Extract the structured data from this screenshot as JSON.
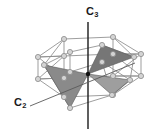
{
  "figure": {
    "name": "symmetry-axes-diagram",
    "background_color": "#ffffff"
  },
  "labels": {
    "c3": {
      "text": "C",
      "subscript": "3",
      "name": "c3-axis-label"
    },
    "c2": {
      "text": "C",
      "subscript": "2",
      "name": "c2-axis-label"
    }
  },
  "colors": {
    "axis_line": "#1a1a1a",
    "cage_edge": "#8c8c8c",
    "vertex_fill": "#d4d4d4",
    "vertex_stroke": "#8a8a8a",
    "face_dark": "#767676",
    "face_mid": "#8a8a8a",
    "face_light": "#9e9e9e",
    "face_edge": "#5a5a5a",
    "center_dot": "#111111"
  },
  "geometry": {
    "center": {
      "x": 88,
      "y": 74
    },
    "c3_axis": {
      "x1": 88,
      "y1": 22,
      "x2": 88,
      "y2": 129
    },
    "c2_axis": {
      "x1": 30,
      "y1": 106,
      "x2": 135,
      "y2": 63
    },
    "top_hexagon": [
      {
        "x": 68,
        "y": 46
      },
      {
        "x": 108,
        "y": 44
      },
      {
        "x": 132,
        "y": 58
      },
      {
        "x": 115,
        "y": 70
      },
      {
        "x": 73,
        "y": 71
      },
      {
        "x": 49,
        "y": 57
      }
    ],
    "bottom_hexagon": [
      {
        "x": 68,
        "y": 65
      },
      {
        "x": 108,
        "y": 63
      },
      {
        "x": 132,
        "y": 77
      },
      {
        "x": 115,
        "y": 90
      },
      {
        "x": 73,
        "y": 91
      },
      {
        "x": 49,
        "y": 76
      }
    ],
    "outer_top": [
      {
        "x": 64,
        "y": 39
      },
      {
        "x": 113,
        "y": 37
      },
      {
        "x": 141,
        "y": 54
      },
      {
        "x": 141,
        "y": 76
      },
      {
        "x": 113,
        "y": 95
      },
      {
        "x": 64,
        "y": 97
      },
      {
        "x": 38,
        "y": 79
      },
      {
        "x": 38,
        "y": 57
      }
    ],
    "faces": [
      {
        "name": "blade-upper",
        "tone": "dark",
        "points": "88,74 102,45 134,57"
      },
      {
        "name": "blade-left",
        "tone": "mid",
        "points": "88,74 44,65 70,108"
      },
      {
        "name": "blade-right",
        "tone": "light",
        "points": "88,74 130,80 112,95"
      }
    ],
    "vertex_radius": 2.6,
    "vertex_count": 18
  }
}
